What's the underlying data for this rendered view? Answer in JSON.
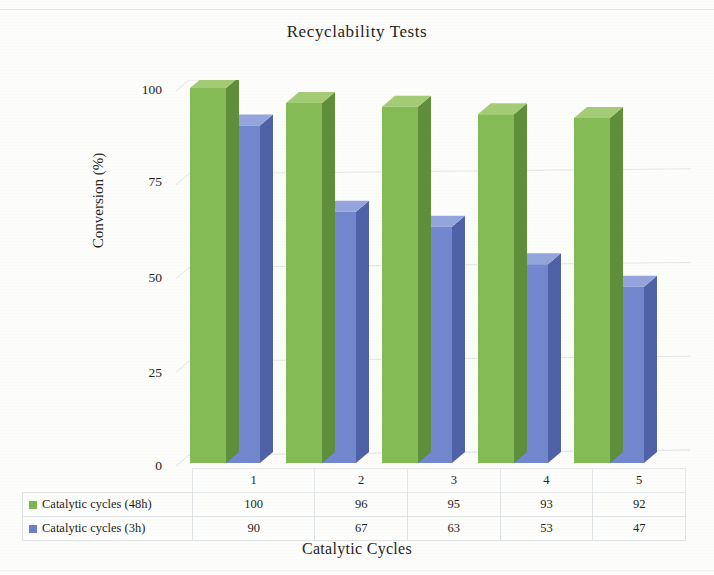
{
  "chart_data": {
    "type": "bar",
    "title": "Recyclability Tests",
    "xlabel": "Catalytic Cycles",
    "ylabel": "Conversion (%)",
    "categories": [
      "1",
      "2",
      "3",
      "4",
      "5"
    ],
    "ylim": [
      0,
      100
    ],
    "yticks": [
      "0",
      "25",
      "50",
      "75",
      "100"
    ],
    "grid": true,
    "legend_position": "bottom-table",
    "three_d": true,
    "series": [
      {
        "name": "Catalytic cycles (48h)",
        "color": "#7fb44e",
        "values": [
          100,
          96,
          95,
          93,
          92
        ]
      },
      {
        "name": "Catalytic cycles (3h)",
        "color": "#6c80c8",
        "values": [
          90,
          67,
          63,
          53,
          47
        ]
      }
    ]
  },
  "table": {
    "corner": "",
    "header": [
      "1",
      "2",
      "3",
      "4",
      "5"
    ],
    "rows": [
      {
        "label": "Catalytic cycles (48h)",
        "swatch": "#7fb44e",
        "cells": [
          "100",
          "96",
          "95",
          "93",
          "92"
        ]
      },
      {
        "label": "Catalytic cycles (3h)",
        "swatch": "#6c80c8",
        "cells": [
          "90",
          "67",
          "63",
          "53",
          "47"
        ]
      }
    ]
  },
  "colors": {
    "green_front": "#85bb55",
    "green_top": "#a4cc76",
    "green_side": "#5f8f3b",
    "blue_front": "#7287cd",
    "blue_top": "#94a4dc",
    "blue_side": "#4f62a5",
    "gridline": "#dedede",
    "axis": "#d8d8d8",
    "text": "#232323"
  }
}
